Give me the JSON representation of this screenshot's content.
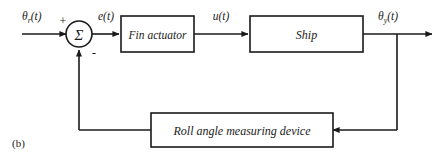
{
  "figure": {
    "caption": "(b)",
    "type": "control-system-block-diagram",
    "ink_color": "#1a1a1a",
    "background_color": "#ffffff"
  },
  "signals": {
    "reference_input": "θ",
    "reference_input_sub": "r",
    "reference_input_tail": "(t)",
    "error": "e(t)",
    "control": "u(t)",
    "output": "θ",
    "output_sub": "y",
    "output_tail": "(t)"
  },
  "summing_junction": {
    "glyph": "Σ",
    "plus_sign": "+",
    "minus_sign": "-"
  },
  "blocks": [
    {
      "id": "fin-actuator",
      "label": "Fin actuator"
    },
    {
      "id": "ship",
      "label": "Ship"
    },
    {
      "id": "roll-angle-measuring-device",
      "label": "Roll angle measuring device"
    }
  ]
}
